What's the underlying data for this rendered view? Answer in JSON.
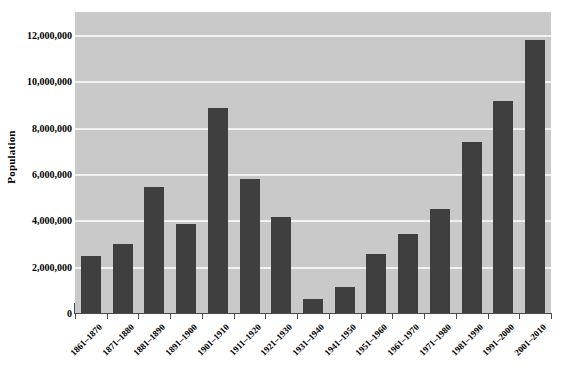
{
  "chart_data": {
    "type": "bar",
    "title": "",
    "xlabel": "",
    "ylabel": "Population",
    "ylim": [
      0,
      13000000
    ],
    "grid": true,
    "legend": false,
    "y_ticks": [
      {
        "value": 0,
        "label": "0"
      },
      {
        "value": 2000000,
        "label": "2,000,000"
      },
      {
        "value": 4000000,
        "label": "4,000,000"
      },
      {
        "value": 6000000,
        "label": "6,000,000"
      },
      {
        "value": 8000000,
        "label": "8,000,000"
      },
      {
        "value": 10000000,
        "label": "10,000,000"
      },
      {
        "value": 12000000,
        "label": "12,000,000"
      }
    ],
    "categories": [
      "1861–1870",
      "1871–1880",
      "1881–1890",
      "1891–1900",
      "1901–1910",
      "1911–1920",
      "1921–1930",
      "1931–1940",
      "1941–1950",
      "1951–1960",
      "1961–1970",
      "1971–1980",
      "1981–1990",
      "1991–2000",
      "2001–2010"
    ],
    "values": [
      2450000,
      3000000,
      5450000,
      3850000,
      8850000,
      5800000,
      4150000,
      620000,
      1120000,
      2550000,
      3400000,
      4500000,
      7400000,
      9150000,
      11800000
    ]
  },
  "style": {
    "bar_color": "#3f3f3f",
    "plot_background": "#c9c9c9",
    "gridline_color": "#f2f2f2",
    "axis_color": "#4a4a4a",
    "page_background": "#ffffff",
    "text_color": "#000000"
  }
}
